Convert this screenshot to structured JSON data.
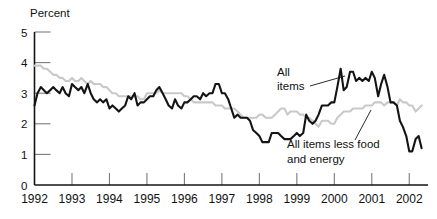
{
  "chart_data": {
    "type": "line",
    "title": "",
    "xlabel": "",
    "ylabel": "Percent",
    "xlim": [
      1992.0,
      2002.5
    ],
    "ylim": [
      0,
      5
    ],
    "grid": false,
    "legend_position": "inline-annotations",
    "y_ticks": [
      "0",
      "1",
      "2",
      "3",
      "4",
      "5"
    ],
    "y_tick_values": [
      0,
      1,
      2,
      3,
      4,
      5
    ],
    "x_ticks": [
      "1992",
      "1993",
      "1994",
      "1995",
      "1996",
      "1997",
      "1998",
      "1999",
      "2000",
      "2001",
      "2002"
    ],
    "x_tick_values": [
      1992,
      1993,
      1994,
      1995,
      1996,
      1997,
      1998,
      1999,
      2000,
      2001,
      2002
    ],
    "annotations": [
      {
        "name": "all-items",
        "text_line1": "All",
        "text_line2": "items",
        "series": "All items"
      },
      {
        "name": "all-items-less-food-energy",
        "text_line1": "All items less food",
        "text_line2": "and energy",
        "series": "All items less food and energy"
      }
    ],
    "series": [
      {
        "name": "All items",
        "color": "#141414",
        "width": 2.1,
        "x": [
          1992.0,
          1992.08,
          1992.17,
          1992.25,
          1992.33,
          1992.42,
          1992.5,
          1992.58,
          1992.67,
          1992.75,
          1992.83,
          1992.92,
          1993.0,
          1993.08,
          1993.17,
          1993.25,
          1993.33,
          1993.42,
          1993.5,
          1993.58,
          1993.67,
          1993.75,
          1993.83,
          1993.92,
          1994.0,
          1994.08,
          1994.17,
          1994.25,
          1994.33,
          1994.42,
          1994.5,
          1994.58,
          1994.67,
          1994.75,
          1994.83,
          1994.92,
          1995.0,
          1995.08,
          1995.17,
          1995.25,
          1995.33,
          1995.42,
          1995.5,
          1995.58,
          1995.67,
          1995.75,
          1995.83,
          1995.92,
          1996.0,
          1996.08,
          1996.17,
          1996.25,
          1996.33,
          1996.42,
          1996.5,
          1996.58,
          1996.67,
          1996.75,
          1996.83,
          1996.92,
          1997.0,
          1997.08,
          1997.17,
          1997.25,
          1997.33,
          1997.42,
          1997.5,
          1997.58,
          1997.67,
          1997.75,
          1997.83,
          1997.92,
          1998.0,
          1998.08,
          1998.17,
          1998.25,
          1998.33,
          1998.42,
          1998.5,
          1998.58,
          1998.67,
          1998.75,
          1998.83,
          1998.92,
          1999.0,
          1999.08,
          1999.17,
          1999.25,
          1999.33,
          1999.42,
          1999.5,
          1999.58,
          1999.67,
          1999.75,
          1999.83,
          1999.92,
          2000.0,
          2000.08,
          2000.17,
          2000.25,
          2000.33,
          2000.42,
          2000.5,
          2000.58,
          2000.67,
          2000.75,
          2000.83,
          2000.92,
          2001.0,
          2001.08,
          2001.17,
          2001.25,
          2001.33,
          2001.42,
          2001.5,
          2001.58,
          2001.67,
          2001.75,
          2001.83,
          2001.92,
          2002.0,
          2002.08,
          2002.17,
          2002.25,
          2002.33
        ],
        "y": [
          2.6,
          3.0,
          3.2,
          3.1,
          3.0,
          3.1,
          3.2,
          3.1,
          3.0,
          3.2,
          3.0,
          2.9,
          3.3,
          3.2,
          3.1,
          3.2,
          3.0,
          3.3,
          3.0,
          2.8,
          2.7,
          2.8,
          2.7,
          2.8,
          2.5,
          2.6,
          2.5,
          2.4,
          2.5,
          2.6,
          2.9,
          2.8,
          3.0,
          2.6,
          2.7,
          2.7,
          2.8,
          2.9,
          2.9,
          3.1,
          3.2,
          3.0,
          2.8,
          2.6,
          2.5,
          2.8,
          2.6,
          2.5,
          2.7,
          2.7,
          2.8,
          2.9,
          2.9,
          2.8,
          3.0,
          2.9,
          3.0,
          3.0,
          3.3,
          3.3,
          3.0,
          3.0,
          2.8,
          2.5,
          2.2,
          2.3,
          2.2,
          2.2,
          2.2,
          2.1,
          1.8,
          1.7,
          1.6,
          1.4,
          1.4,
          1.4,
          1.7,
          1.7,
          1.7,
          1.6,
          1.5,
          1.5,
          1.5,
          1.6,
          1.7,
          1.6,
          1.7,
          2.3,
          2.1,
          2.0,
          2.1,
          2.3,
          2.6,
          2.6,
          2.6,
          2.7,
          2.7,
          3.2,
          3.8,
          3.1,
          3.2,
          3.7,
          3.7,
          3.4,
          3.5,
          3.4,
          3.5,
          3.4,
          3.7,
          3.5,
          2.9,
          3.3,
          3.6,
          3.2,
          2.7,
          2.7,
          2.6,
          2.1,
          1.9,
          1.6,
          1.1,
          1.1,
          1.5,
          1.6,
          1.2
        ]
      },
      {
        "name": "All items less food and energy",
        "color": "#c9c9c9",
        "width": 2.1,
        "x": [
          1992.0,
          1992.08,
          1992.17,
          1992.25,
          1992.33,
          1992.42,
          1992.5,
          1992.58,
          1992.67,
          1992.75,
          1992.83,
          1992.92,
          1993.0,
          1993.08,
          1993.17,
          1993.25,
          1993.33,
          1993.42,
          1993.5,
          1993.58,
          1993.67,
          1993.75,
          1993.83,
          1993.92,
          1994.0,
          1994.08,
          1994.17,
          1994.25,
          1994.33,
          1994.42,
          1994.5,
          1994.58,
          1994.67,
          1994.75,
          1994.83,
          1994.92,
          1995.0,
          1995.08,
          1995.17,
          1995.25,
          1995.33,
          1995.42,
          1995.5,
          1995.58,
          1995.67,
          1995.75,
          1995.83,
          1995.92,
          1996.0,
          1996.08,
          1996.17,
          1996.25,
          1996.33,
          1996.42,
          1996.5,
          1996.58,
          1996.67,
          1996.75,
          1996.83,
          1996.92,
          1997.0,
          1997.08,
          1997.17,
          1997.25,
          1997.33,
          1997.42,
          1997.5,
          1997.58,
          1997.67,
          1997.75,
          1997.83,
          1997.92,
          1998.0,
          1998.08,
          1998.17,
          1998.25,
          1998.33,
          1998.42,
          1998.5,
          1998.58,
          1998.67,
          1998.75,
          1998.83,
          1998.92,
          1999.0,
          1999.08,
          1999.17,
          1999.25,
          1999.33,
          1999.42,
          1999.5,
          1999.58,
          1999.67,
          1999.75,
          1999.83,
          1999.92,
          2000.0,
          2000.08,
          2000.17,
          2000.25,
          2000.33,
          2000.42,
          2000.5,
          2000.58,
          2000.67,
          2000.75,
          2000.83,
          2000.92,
          2001.0,
          2001.08,
          2001.17,
          2001.25,
          2001.33,
          2001.42,
          2001.5,
          2001.58,
          2001.67,
          2001.75,
          2001.83,
          2001.92,
          2002.0,
          2002.08,
          2002.17,
          2002.25,
          2002.33
        ],
        "y": [
          3.9,
          3.9,
          3.9,
          3.8,
          3.8,
          3.7,
          3.6,
          3.6,
          3.5,
          3.5,
          3.4,
          3.4,
          3.5,
          3.4,
          3.4,
          3.5,
          3.4,
          3.3,
          3.4,
          3.3,
          3.3,
          3.3,
          3.2,
          3.2,
          3.1,
          3.0,
          3.0,
          2.9,
          2.9,
          2.9,
          2.9,
          2.9,
          2.9,
          2.9,
          2.8,
          2.8,
          3.0,
          3.0,
          3.0,
          3.0,
          3.1,
          3.0,
          3.0,
          3.0,
          3.0,
          3.0,
          3.0,
          3.0,
          2.9,
          2.9,
          2.8,
          2.7,
          2.7,
          2.7,
          2.7,
          2.7,
          2.7,
          2.7,
          2.6,
          2.6,
          2.6,
          2.5,
          2.5,
          2.5,
          2.5,
          2.4,
          2.3,
          2.2,
          2.2,
          2.2,
          2.2,
          2.2,
          2.3,
          2.3,
          2.2,
          2.2,
          2.2,
          2.3,
          2.4,
          2.5,
          2.5,
          2.3,
          2.4,
          2.4,
          2.4,
          2.3,
          2.3,
          2.2,
          2.2,
          2.1,
          2.0,
          1.9,
          2.1,
          2.1,
          2.1,
          2.0,
          2.0,
          2.2,
          2.3,
          2.4,
          2.4,
          2.4,
          2.5,
          2.5,
          2.5,
          2.5,
          2.6,
          2.6,
          2.6,
          2.7,
          2.7,
          2.7,
          2.6,
          2.7,
          2.7,
          2.7,
          2.6,
          2.8,
          2.7,
          2.7,
          2.6,
          2.6,
          2.4,
          2.5,
          2.6
        ]
      }
    ]
  }
}
